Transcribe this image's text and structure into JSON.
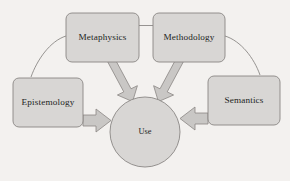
{
  "diagram": {
    "type": "concept-flow-diagram",
    "background_color": "#f3f1ef",
    "shape_fill": "#d8d6d4",
    "shape_stroke": "#8a8784",
    "arrow_fill": "#c9c7c5",
    "arrow_stroke": "#8a8784",
    "text_color": "#231f1e",
    "nodes": [
      {
        "id": "metaphysics",
        "label": "Metaphysics",
        "shape": "rounded-rect",
        "position": "top-left"
      },
      {
        "id": "methodology",
        "label": "Methodology",
        "shape": "rounded-rect",
        "position": "top-right"
      },
      {
        "id": "epistemology",
        "label": "Epistemology",
        "shape": "rounded-rect",
        "position": "middle-left"
      },
      {
        "id": "semantics",
        "label": "Semantics",
        "shape": "rounded-rect",
        "position": "middle-right"
      },
      {
        "id": "use",
        "label": "Use",
        "shape": "circle",
        "position": "center"
      }
    ],
    "arrows": [
      {
        "id": "metaphysics-to-use",
        "from": "metaphysics",
        "to": "use",
        "style": "block-arrow",
        "direction": "down-right"
      },
      {
        "id": "methodology-to-use",
        "from": "methodology",
        "to": "use",
        "style": "block-arrow",
        "direction": "down-left"
      },
      {
        "id": "epistemology-to-use",
        "from": "epistemology",
        "to": "use",
        "style": "block-arrow",
        "direction": "right"
      },
      {
        "id": "semantics-to-use",
        "from": "semantics",
        "to": "use",
        "style": "block-arrow",
        "direction": "left"
      }
    ],
    "connectors": [
      {
        "id": "metaphysics-methodology",
        "from": "metaphysics",
        "to": "methodology",
        "style": "straight-line"
      },
      {
        "id": "metaphysics-epistemology",
        "from": "metaphysics",
        "to": "epistemology",
        "style": "curved-line"
      },
      {
        "id": "methodology-semantics",
        "from": "methodology",
        "to": "semantics",
        "style": "curved-line"
      }
    ]
  }
}
